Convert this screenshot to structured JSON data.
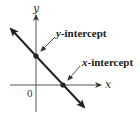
{
  "diagram": {
    "type": "coordinate-graph",
    "axes": {
      "x_label": "x",
      "y_label": "y",
      "origin_label": "0"
    },
    "line": {
      "description": "line with negative slope",
      "color": "#222222"
    },
    "annotations": [
      {
        "id": "y-intercept",
        "var": "y",
        "text": "-intercept"
      },
      {
        "id": "x-intercept",
        "var": "x",
        "text": "-intercept"
      }
    ],
    "colors": {
      "axis": "#555555",
      "line": "#222222",
      "point": "#222222",
      "text": "#222222"
    }
  }
}
